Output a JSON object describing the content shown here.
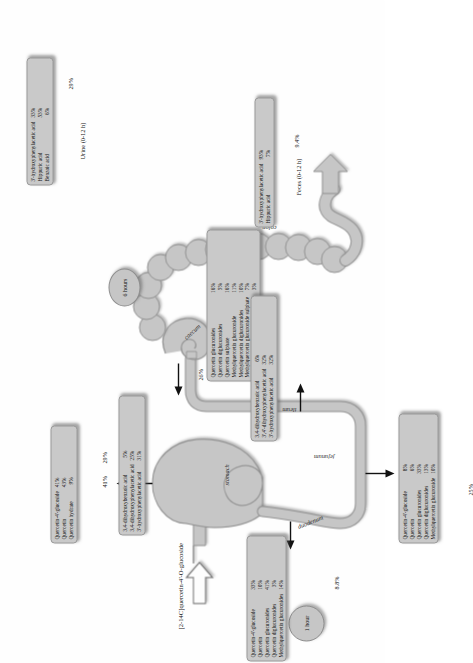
{
  "figure": {
    "title": "[2-14C]quercetin-4'-O-glucoside",
    "time_markers": [
      {
        "name": "1 hour",
        "label": "1 hour"
      },
      {
        "name": "6 hours",
        "label": "6 hours"
      }
    ],
    "organs": [
      {
        "name": "stomach",
        "label": "stomach"
      },
      {
        "name": "duodenum",
        "label": "duodenum"
      },
      {
        "name": "jejunum",
        "label": "jejunum"
      },
      {
        "name": "ileum",
        "label": "ileum"
      },
      {
        "name": "caecum",
        "label": "caecum"
      },
      {
        "name": "colon",
        "label": "colon"
      }
    ],
    "excreta": [
      {
        "name": "urine",
        "label": "Urine (0-12 h)"
      },
      {
        "name": "feces",
        "label": "Feces (0-12 h)"
      }
    ],
    "recovery_labels": {
      "stomach": "41%",
      "duodenum": "8.8%",
      "jejunum": "25%",
      "ileum": "26%",
      "caecum": "29%",
      "colon": "14%",
      "urine": "29%",
      "feces": "9.4%"
    },
    "boxes": [
      {
        "name": "stomach-box",
        "pct": "41%",
        "rows": [
          {
            "compound": "Quercetin-4'-glucoside",
            "value": "41%"
          },
          {
            "compound": "Quercetin",
            "value": "43%"
          },
          {
            "compound": "Quercetin hydrate",
            "value": "9%"
          }
        ]
      },
      {
        "name": "duodenum-box",
        "pct": "8.8%",
        "rows": [
          {
            "compound": "Quercetin-4'-glucoside",
            "value": "33%"
          },
          {
            "compound": "Quercetin",
            "value": "10%"
          },
          {
            "compound": "Quercetin glucuronides",
            "value": "41%"
          },
          {
            "compound": "Quercetin diglucuronides",
            "value": "3%"
          },
          {
            "compound": "Methylquercetin glucuronides",
            "value": "14%"
          }
        ]
      },
      {
        "name": "jejunum-box",
        "pct": "25%",
        "rows": [
          {
            "compound": "Quercetin-4'-glucoside",
            "value": "8%"
          },
          {
            "compound": "Quercetin",
            "value": "6%"
          },
          {
            "compound": "Quercetin glucuronides",
            "value": "33%"
          },
          {
            "compound": "Quercetin diglucuronides",
            "value": "13%"
          },
          {
            "compound": "Methylquercetin glucuronide",
            "value": "10%"
          }
        ]
      },
      {
        "name": "ileum-box",
        "pct": "26%",
        "rows": [
          {
            "compound": "Quercetin glucuronides",
            "value": "16%"
          },
          {
            "compound": "Quercetin diglucuronides",
            "value": "5%"
          },
          {
            "compound": "Quercetin sulphate",
            "value": "16%"
          },
          {
            "compound": "Methylquercetin glucuronide",
            "value": "11%"
          },
          {
            "compound": "Methylquercetin diglucuronides",
            "value": "10%"
          },
          {
            "compound": "Methylquercetin glucuronide sulphate",
            "value": "7%"
          },
          {
            "compound": "3,4-dihydroxybenzoic acid",
            "value": "3%"
          }
        ]
      },
      {
        "name": "caecum-box",
        "pct": "29%",
        "rows": [
          {
            "compound": "3,4-dihydroxybenzoic acid",
            "value": "5%"
          },
          {
            "compound": "3,4-dihydroxyphenylacetic acid",
            "value": "25%"
          },
          {
            "compound": "3'-hydroxyphenylacetic acid",
            "value": "31%"
          }
        ]
      },
      {
        "name": "colon-box",
        "pct": "14%",
        "rows": [
          {
            "compound": "3,4-dihydroxybenzoic acid",
            "value": "6%"
          },
          {
            "compound": "3',4'-dihydroxyphenylacetic acid",
            "value": "32%"
          },
          {
            "compound": "3'-hydroxyphenylacetic acid",
            "value": "32%"
          }
        ]
      },
      {
        "name": "urine-box",
        "pct": "29%",
        "caption": "Urine (0-12 h)",
        "rows": [
          {
            "compound": "3'-hydroxyphenylacetic acid",
            "value": "33%"
          },
          {
            "compound": "Hippuric acid",
            "value": "53%"
          },
          {
            "compound": "Benzoic acid",
            "value": "6%"
          }
        ]
      },
      {
        "name": "feces-box",
        "pct": "9.4%",
        "caption": "Feces (0-12 h)",
        "rows": [
          {
            "compound": "3'-hydroxyphenylacetic acid",
            "value": "93%"
          },
          {
            "compound": "Hippuric acid",
            "value": "7%"
          }
        ]
      }
    ],
    "colors": {
      "organ_fill": "#c6c6c6",
      "organ_stroke": "#8e8e8e",
      "box_fill": "#c9c9c9",
      "text": "#131313",
      "background": "#fefefe"
    }
  }
}
